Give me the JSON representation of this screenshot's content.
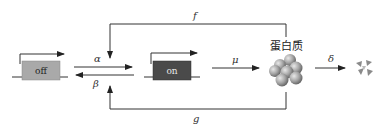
{
  "diagram": {
    "type": "gene-expression-kinetics",
    "states": {
      "off": {
        "label": "off",
        "fill": "#a9a9a9",
        "text_color": "#222222"
      },
      "on": {
        "label": "on",
        "fill": "#4a4a4a",
        "text_color": "#e8e8e8"
      }
    },
    "rates": {
      "activation": "α",
      "inactivation": "β",
      "synthesis": "μ",
      "degradation": "δ",
      "feedback_f": "f",
      "feedback_g": "g"
    },
    "product": {
      "label": "蛋白质"
    },
    "colors": {
      "line": "#333333",
      "protein": "#9a9a9a",
      "fragment": "#8a8a8a"
    }
  }
}
